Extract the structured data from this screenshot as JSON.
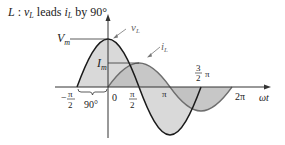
{
  "title": {
    "prefix": "L",
    "colon": " : ",
    "v": "v",
    "v_sub": "L",
    "leads": " leads ",
    "i": "i",
    "i_sub": "L",
    "by": " by 90°"
  },
  "labels": {
    "vm": "V",
    "vm_sub": "m",
    "im": "I",
    "im_sub": "m",
    "vL": "v",
    "vL_sub": "L",
    "iL": "i",
    "iL_sub": "L",
    "phase": "90°",
    "omega_t": "ωt"
  },
  "ticks": {
    "neg_pi_half_num": "π",
    "neg_pi_half_den": "2",
    "neg_sign": "−",
    "zero": "0",
    "pi_half_num": "π",
    "pi_half_den": "2",
    "pi": "π",
    "three_half_num": "3",
    "three_half_den": "2",
    "three_half_pi": "π",
    "two_pi": "2π"
  },
  "colors": {
    "vL_fill": "#d9d9d9",
    "iL_fill": "#c4c4c4",
    "vL_stroke": "#1a1a1a",
    "iL_stroke": "#6e6e6e",
    "axis": "#333333"
  }
}
